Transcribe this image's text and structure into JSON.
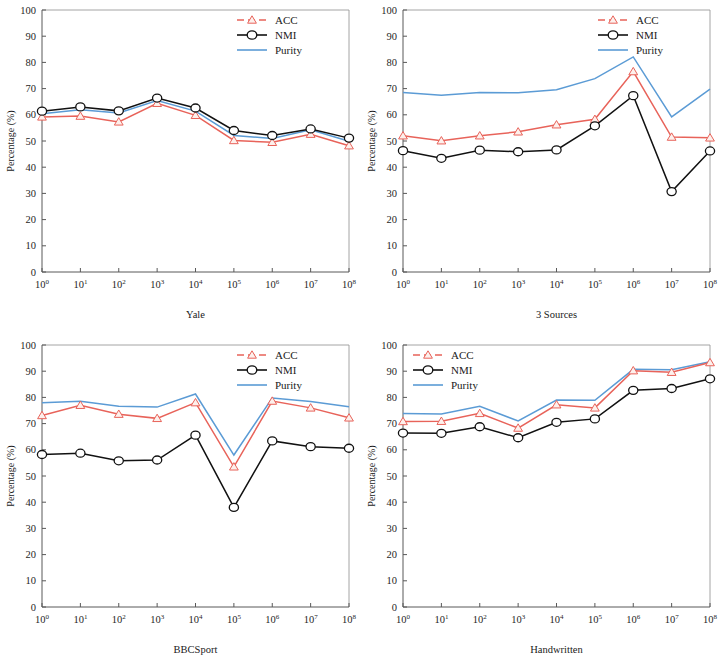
{
  "figure": {
    "ylabel": "Percentage (%)",
    "y_ticks": [
      "0",
      "10",
      "20",
      "30",
      "40",
      "50",
      "60",
      "70",
      "80",
      "90",
      "100"
    ],
    "x_tick_base": "10",
    "x_tick_exponents": [
      "0",
      "1",
      "2",
      "3",
      "4",
      "5",
      "6",
      "7",
      "8"
    ],
    "legend_labels": {
      "acc": "ACC",
      "nmi": "NMI",
      "purity": "Purity"
    },
    "colors": {
      "acc": "#e8635a",
      "nmi": "#111111",
      "purity": "#5b9bd5"
    }
  },
  "panels": [
    {
      "id": "a",
      "caption": "(a)",
      "xlabel": "Yale",
      "legend_pos": "right"
    },
    {
      "id": "b",
      "caption": "(b)",
      "xlabel": "3 Sources",
      "legend_pos": "right"
    },
    {
      "id": "c",
      "caption": "(c)",
      "xlabel": "BBCSport",
      "legend_pos": "right"
    },
    {
      "id": "d",
      "caption": "(d)",
      "xlabel": "Handwritten",
      "legend_pos": "left"
    }
  ],
  "chart_data": [
    {
      "type": "line",
      "panel": "a",
      "title": "(a)",
      "xlabel": "Yale",
      "ylabel": "Percentage (%)",
      "xscale": "log",
      "x": [
        1,
        10,
        100,
        1000,
        10000,
        100000,
        1000000,
        10000000,
        100000000
      ],
      "x_tick_labels": [
        "10^0",
        "10^1",
        "10^2",
        "10^3",
        "10^4",
        "10^5",
        "10^6",
        "10^7",
        "10^8"
      ],
      "ylim": [
        0,
        100
      ],
      "xlim_exp": [
        0,
        8
      ],
      "grid": false,
      "legend_position": "top-right",
      "series": [
        {
          "name": "ACC",
          "values": [
            59.2,
            59.5,
            57.3,
            64.4,
            59.8,
            50.2,
            49.5,
            52.6,
            48.2
          ]
        },
        {
          "name": "NMI",
          "values": [
            61.4,
            63.0,
            61.5,
            66.4,
            62.6,
            54.0,
            52.1,
            54.6,
            51.1
          ]
        },
        {
          "name": "Purity",
          "values": [
            60.4,
            61.9,
            60.7,
            65.4,
            61.4,
            52.1,
            51.0,
            54.3,
            49.9
          ]
        }
      ]
    },
    {
      "type": "line",
      "panel": "b",
      "title": "(b)",
      "xlabel": "3 Sources",
      "ylabel": "Percentage (%)",
      "xscale": "log",
      "x": [
        1,
        10,
        100,
        1000,
        10000,
        100000,
        1000000,
        10000000,
        100000000
      ],
      "x_tick_labels": [
        "10^0",
        "10^1",
        "10^2",
        "10^3",
        "10^4",
        "10^5",
        "10^6",
        "10^7",
        "10^8"
      ],
      "ylim": [
        0,
        100
      ],
      "xlim_exp": [
        0,
        8
      ],
      "grid": false,
      "legend_position": "top-right",
      "series": [
        {
          "name": "ACC",
          "values": [
            52.0,
            50.1,
            52.0,
            53.5,
            56.2,
            58.3,
            76.5,
            51.5,
            51.2
          ]
        },
        {
          "name": "NMI",
          "values": [
            46.3,
            43.4,
            46.5,
            45.9,
            46.6,
            55.8,
            67.3,
            30.7,
            46.2
          ]
        },
        {
          "name": "Purity",
          "values": [
            68.5,
            67.5,
            68.5,
            68.4,
            69.6,
            73.8,
            82.1,
            59.2,
            69.8
          ]
        }
      ]
    },
    {
      "type": "line",
      "panel": "c",
      "title": "(c)",
      "xlabel": "BBCSport",
      "ylabel": "Percentage (%)",
      "xscale": "log",
      "x": [
        1,
        10,
        100,
        1000,
        10000,
        100000,
        1000000,
        10000000,
        100000000
      ],
      "x_tick_labels": [
        "10^0",
        "10^1",
        "10^2",
        "10^3",
        "10^4",
        "10^5",
        "10^6",
        "10^7",
        "10^8"
      ],
      "ylim": [
        0,
        100
      ],
      "xlim_exp": [
        0,
        8
      ],
      "grid": false,
      "legend_position": "top-right",
      "series": [
        {
          "name": "ACC",
          "values": [
            73.1,
            77.0,
            73.6,
            72.0,
            78.0,
            53.5,
            78.6,
            76.0,
            72.2
          ]
        },
        {
          "name": "NMI",
          "values": [
            58.2,
            58.7,
            55.8,
            56.1,
            65.6,
            38.0,
            63.4,
            61.2,
            60.6
          ]
        },
        {
          "name": "Purity",
          "values": [
            78.0,
            78.5,
            76.6,
            76.3,
            81.3,
            58.0,
            79.8,
            78.4,
            76.4
          ]
        }
      ]
    },
    {
      "type": "line",
      "panel": "d",
      "title": "(d)",
      "xlabel": "Handwritten",
      "ylabel": "Percentage (%)",
      "xscale": "log",
      "x": [
        1,
        10,
        100,
        1000,
        10000,
        100000,
        1000000,
        10000000,
        100000000
      ],
      "x_tick_labels": [
        "10^0",
        "10^1",
        "10^2",
        "10^3",
        "10^4",
        "10^5",
        "10^6",
        "10^7",
        "10^8"
      ],
      "ylim": [
        0,
        100
      ],
      "xlim_exp": [
        0,
        8
      ],
      "grid": false,
      "legend_position": "top-left",
      "series": [
        {
          "name": "ACC",
          "values": [
            70.8,
            70.9,
            73.9,
            68.3,
            77.2,
            76.0,
            90.2,
            89.6,
            93.3
          ]
        },
        {
          "name": "NMI",
          "values": [
            66.4,
            66.3,
            68.8,
            64.6,
            70.5,
            71.8,
            82.7,
            83.4,
            87.1
          ]
        },
        {
          "name": "Purity",
          "values": [
            73.9,
            73.7,
            76.6,
            71.0,
            79.0,
            78.9,
            90.7,
            90.6,
            93.6
          ]
        }
      ]
    }
  ]
}
